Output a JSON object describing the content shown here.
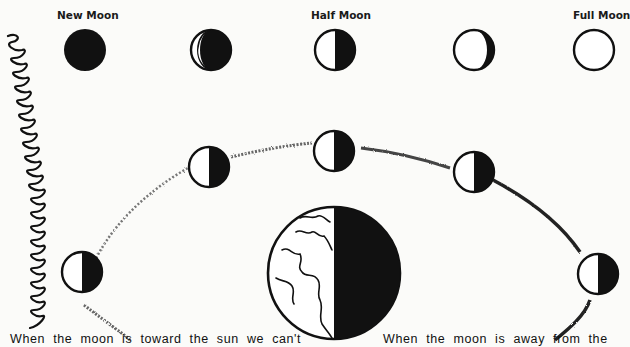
{
  "labels": {
    "new_moon": "New Moon",
    "half_moon": "Half Moon",
    "full_moon": "Full Moon"
  },
  "top_row_phases": [
    {
      "name": "new-moon",
      "label": "New Moon"
    },
    {
      "name": "waxing-crescent"
    },
    {
      "name": "half-moon",
      "label": "Half Moon"
    },
    {
      "name": "waxing-gibbous"
    },
    {
      "name": "full-moon",
      "label": "Full Moon"
    }
  ],
  "orbit_moons": [
    {
      "position": "left",
      "lit_side": "left"
    },
    {
      "position": "upper-left",
      "lit_side": "left"
    },
    {
      "position": "top",
      "lit_side": "left"
    },
    {
      "position": "upper-right",
      "lit_side": "left"
    },
    {
      "position": "right",
      "lit_side": "left"
    }
  ],
  "earth": {
    "lit_side": "left",
    "dark_side": "right"
  },
  "captions": {
    "left": "When the moon is toward the sun we can't",
    "right": "When the moon is away from the"
  },
  "colors": {
    "ink": "#111111",
    "paper": "#fbfbf9",
    "orbit": "#555555"
  }
}
